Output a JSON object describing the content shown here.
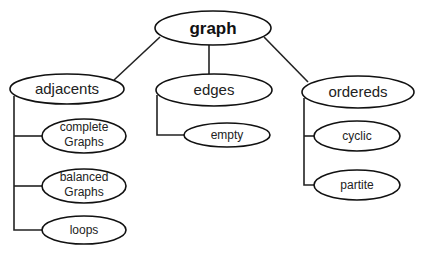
{
  "diagram": {
    "type": "tree",
    "root": {
      "id": "graph",
      "label": "graph"
    },
    "nodes": {
      "graph": {
        "label": "graph"
      },
      "adjacents": {
        "label": "adjacents"
      },
      "edges": {
        "label": "edges"
      },
      "ordereds": {
        "label": "ordereds"
      },
      "complete_graphs": {
        "line1": "complete",
        "line2": "Graphs"
      },
      "balanced_graphs": {
        "line1": "balanced",
        "line2": "Graphs"
      },
      "loops": {
        "label": "loops"
      },
      "empty": {
        "label": "empty"
      },
      "cyclic": {
        "label": "cyclic"
      },
      "partite": {
        "label": "partite"
      }
    },
    "edges": [
      [
        "graph",
        "adjacents"
      ],
      [
        "graph",
        "edges"
      ],
      [
        "graph",
        "ordereds"
      ],
      [
        "adjacents",
        "complete Graphs"
      ],
      [
        "adjacents",
        "balanced Graphs"
      ],
      [
        "adjacents",
        "loops"
      ],
      [
        "edges",
        "empty"
      ],
      [
        "ordereds",
        "cyclic"
      ],
      [
        "ordereds",
        "partite"
      ]
    ]
  }
}
